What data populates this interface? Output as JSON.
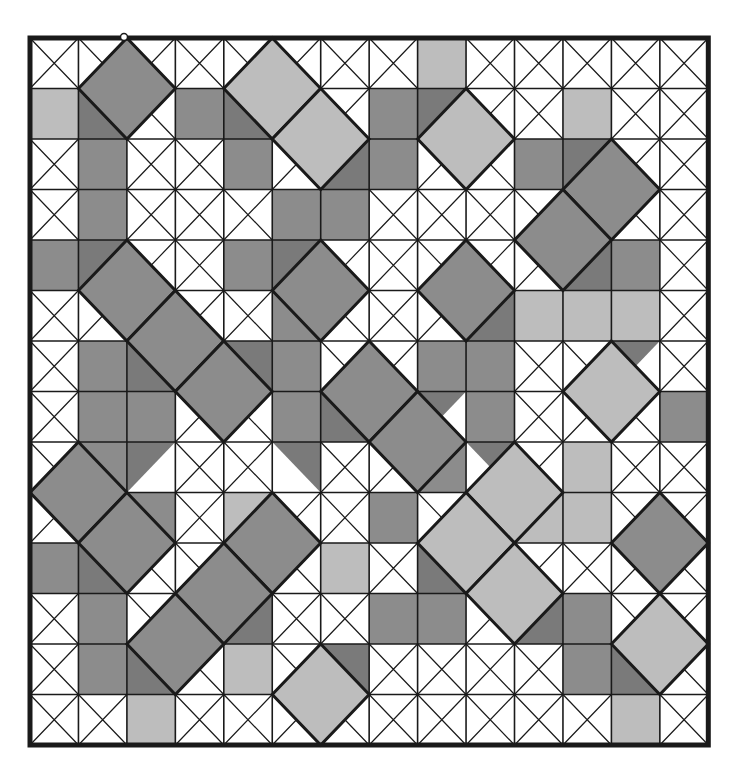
{
  "board": {
    "cols": 14,
    "rows": 14,
    "origin": [
      30,
      38
    ],
    "cell_w": 48.45,
    "cell_h": 50.5,
    "colors": {
      "white": "#ffffff",
      "dark": "#8c8c8c",
      "darker": "#7a7a7a",
      "light": "#bdbdbd",
      "line": "#1a1a1a"
    },
    "grid": [
      "........L.....",
      "L..D...D...L..",
      ".D..D..D..D...",
      ".D...DD.......",
      "D...D.......D.",
      ".....D....LLL.",
      ".D...D..DD....",
      ".DD..D...D...D",
      ".DD.....DD.L..",
      "..D.L..D..LL..",
      "D.....L.L.....",
      ".D.....DD.LD..",
      ".D..L......DD.",
      "..L.........L."
    ],
    "diamonds": [
      {
        "c": 2,
        "r": 1,
        "color": "dark"
      },
      {
        "c": 5,
        "r": 1,
        "color": "light"
      },
      {
        "c": 6,
        "r": 2,
        "color": "light"
      },
      {
        "c": 9,
        "r": 2,
        "color": "light"
      },
      {
        "c": 12,
        "r": 3,
        "color": "dark"
      },
      {
        "c": 11,
        "r": 4,
        "color": "dark"
      },
      {
        "c": 2,
        "r": 5,
        "color": "dark"
      },
      {
        "c": 6,
        "r": 5,
        "color": "dark"
      },
      {
        "c": 9,
        "r": 5,
        "color": "dark"
      },
      {
        "c": 3,
        "r": 6,
        "color": "dark"
      },
      {
        "c": 4,
        "r": 7,
        "color": "dark"
      },
      {
        "c": 7,
        "r": 7,
        "color": "dark"
      },
      {
        "c": 8,
        "r": 8,
        "color": "dark"
      },
      {
        "c": 12,
        "r": 7,
        "color": "light"
      },
      {
        "c": 1,
        "r": 9,
        "color": "dark"
      },
      {
        "c": 2,
        "r": 10,
        "color": "dark"
      },
      {
        "c": 5,
        "r": 10,
        "color": "dark"
      },
      {
        "c": 10,
        "r": 9,
        "color": "light"
      },
      {
        "c": 9,
        "r": 10,
        "color": "light"
      },
      {
        "c": 13,
        "r": 10,
        "color": "dark"
      },
      {
        "c": 4,
        "r": 11,
        "color": "dark"
      },
      {
        "c": 3,
        "r": 12,
        "color": "dark"
      },
      {
        "c": 10,
        "r": 11,
        "color": "light"
      },
      {
        "c": 13,
        "r": 12,
        "color": "light"
      },
      {
        "c": 6,
        "r": 13,
        "color": "light"
      }
    ],
    "triangles": [
      {
        "c": 1,
        "r": 1,
        "corner": "bl"
      },
      {
        "c": 4,
        "r": 1,
        "corner": "bl"
      },
      {
        "c": 8,
        "r": 1,
        "corner": "tl"
      },
      {
        "c": 6,
        "r": 2,
        "corner": "br"
      },
      {
        "c": 11,
        "r": 2,
        "corner": "tl"
      },
      {
        "c": 1,
        "r": 4,
        "corner": "tl"
      },
      {
        "c": 5,
        "r": 4,
        "corner": "tl"
      },
      {
        "c": 11,
        "r": 4,
        "corner": "br"
      },
      {
        "c": 9,
        "r": 5,
        "corner": "br"
      },
      {
        "c": 2,
        "r": 6,
        "corner": "bl"
      },
      {
        "c": 4,
        "r": 6,
        "corner": "tr"
      },
      {
        "c": 12,
        "r": 6,
        "corner": "tl"
      },
      {
        "c": 6,
        "r": 7,
        "corner": "bl"
      },
      {
        "c": 8,
        "r": 7,
        "corner": "tl"
      },
      {
        "c": 2,
        "r": 8,
        "corner": "tl"
      },
      {
        "c": 5,
        "r": 8,
        "corner": "tr"
      },
      {
        "c": 9,
        "r": 8,
        "corner": "tr"
      },
      {
        "c": 1,
        "r": 10,
        "corner": "bl"
      },
      {
        "c": 8,
        "r": 10,
        "corner": "bl"
      },
      {
        "c": 4,
        "r": 11,
        "corner": "br"
      },
      {
        "c": 10,
        "r": 11,
        "corner": "br"
      },
      {
        "c": 2,
        "r": 12,
        "corner": "bl"
      },
      {
        "c": 6,
        "r": 12,
        "corner": "tr"
      },
      {
        "c": 12,
        "r": 12,
        "corner": "bl"
      }
    ],
    "marker": {
      "x": 124,
      "y": 37
    }
  }
}
